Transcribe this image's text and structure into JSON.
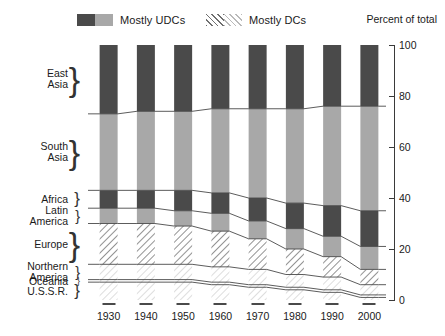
{
  "legend": {
    "entries": [
      {
        "label": "Mostly UDCs",
        "swatch": "split-gray-dark-light",
        "name": "legend-swatch-udc"
      },
      {
        "label": "Mostly DCs",
        "swatch": "split-hatch-dark-light",
        "name": "legend-swatch-dc"
      }
    ]
  },
  "axis_title": "Percent of total",
  "colors": {
    "udc_dark": "#4a4a4a",
    "udc_light": "#a8a8a8",
    "dc_hatch_dark": "#6f6f6f",
    "dc_hatch_light": "#b9b9b9",
    "outline": "#3a3a3a",
    "background": "#ffffff"
  },
  "chart_data": {
    "type": "area",
    "title": "",
    "subtitle": "",
    "xlabel": "",
    "ylabel": "Percent of total",
    "ylim": [
      0,
      100
    ],
    "yticks": [
      0,
      20,
      40,
      60,
      80,
      100
    ],
    "grid": false,
    "legend_position": "top",
    "x": [
      1930,
      1940,
      1950,
      1960,
      1970,
      1980,
      1990,
      2000
    ],
    "x_tick_labels": [
      "1930",
      "1940",
      "1950",
      "1960",
      "1970",
      "1980",
      "1990",
      "2000"
    ],
    "stack_order_bottom_to_top": [
      "U.S.S.R.",
      "Oceania",
      "Northern America",
      "Europe",
      "Latin America",
      "Africa",
      "South Asia",
      "East Asia"
    ],
    "series": [
      {
        "name": "East Asia",
        "group": "Mostly UDCs",
        "fill": "dark-gray",
        "values": [
          27,
          26,
          26,
          25,
          25,
          25,
          24,
          24
        ]
      },
      {
        "name": "South Asia",
        "group": "Mostly UDCs",
        "fill": "light-gray",
        "values": [
          30,
          31,
          31,
          33,
          35,
          37,
          39,
          41
        ]
      },
      {
        "name": "Africa",
        "group": "Mostly UDCs",
        "fill": "dark-gray",
        "values": [
          7,
          7,
          8,
          8,
          9,
          10,
          12,
          14
        ]
      },
      {
        "name": "Latin America",
        "group": "Mostly UDCs",
        "fill": "light-gray",
        "values": [
          6,
          6,
          6,
          7,
          7,
          8,
          8,
          9
        ]
      },
      {
        "name": "Europe",
        "group": "Mostly DCs",
        "fill": "hatch-dark",
        "values": [
          16,
          16,
          15,
          14,
          12,
          10,
          8,
          6
        ]
      },
      {
        "name": "Northern America",
        "group": "Mostly DCs",
        "fill": "hatch-light",
        "values": [
          6,
          6,
          6,
          6,
          6,
          5,
          5,
          4
        ]
      },
      {
        "name": "Oceania",
        "group": "Mostly DCs",
        "fill": "hatch-light",
        "values": [
          1,
          1,
          1,
          1,
          1,
          1,
          1,
          1
        ]
      },
      {
        "name": "U.S.S.R.",
        "group": "Mostly DCs",
        "fill": "hatch-light",
        "values": [
          7,
          7,
          7,
          6,
          5,
          4,
          3,
          1
        ]
      }
    ],
    "cumulative_upper_boundaries_percent": {
      "U.S.S.R.": [
        7,
        7,
        7,
        6,
        5,
        4,
        3,
        1
      ],
      "Oceania": [
        8,
        8,
        8,
        7,
        6,
        5,
        4,
        2
      ],
      "Northern America": [
        14,
        14,
        14,
        13,
        12,
        10,
        9,
        6
      ],
      "Europe": [
        30,
        30,
        29,
        27,
        24,
        20,
        17,
        12
      ],
      "Latin America": [
        36,
        36,
        35,
        34,
        31,
        28,
        25,
        21
      ],
      "Africa": [
        43,
        43,
        43,
        42,
        40,
        38,
        37,
        35
      ],
      "South Asia": [
        73,
        74,
        74,
        75,
        75,
        75,
        76,
        76
      ],
      "East Asia": [
        100,
        100,
        100,
        100,
        100,
        100,
        100,
        100
      ]
    }
  },
  "region_labels": [
    {
      "lines": [
        "East",
        "Asia"
      ],
      "name": "region-label-east-asia"
    },
    {
      "lines": [
        "South",
        "Asia"
      ],
      "name": "region-label-south-asia"
    },
    {
      "lines": [
        "Africa"
      ],
      "name": "region-label-africa"
    },
    {
      "lines": [
        "Latin",
        "America"
      ],
      "name": "region-label-latin-america"
    },
    {
      "lines": [
        "Europe"
      ],
      "name": "region-label-europe"
    },
    {
      "lines": [
        "Northern",
        "America"
      ],
      "name": "region-label-northern-america"
    },
    {
      "lines": [
        "Oceania"
      ],
      "name": "region-label-oceania"
    },
    {
      "lines": [
        "U.S.S.R."
      ],
      "name": "region-label-ussr"
    }
  ]
}
